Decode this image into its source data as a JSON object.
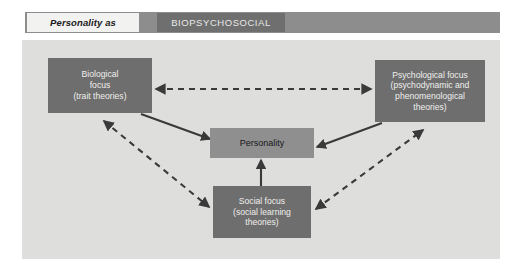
{
  "header": {
    "tag_label": "Personality as",
    "title": "BIOPSYCHOSOCIAL"
  },
  "diagram": {
    "nodes": [
      {
        "id": "biological",
        "lines": [
          "Biological",
          "focus",
          "(trait theories)"
        ],
        "text": "Biological focus (trait theories)"
      },
      {
        "id": "psychological",
        "lines": [
          "Psychological focus",
          "(psychodynamic and",
          "phenomenological",
          "theories)"
        ],
        "text": "Psychological focus (psychodynamic and phenomenological theories)"
      },
      {
        "id": "personality",
        "lines": [
          "Personality"
        ],
        "text": "Personality"
      },
      {
        "id": "social",
        "lines": [
          "Social focus",
          "(social learning",
          "theories)"
        ],
        "text": "Social focus (social learning theories)"
      }
    ],
    "edges": [
      {
        "from": "biological",
        "to": "psychological",
        "style": "dashed",
        "arrows": "both"
      },
      {
        "from": "biological",
        "to": "social",
        "style": "dashed",
        "arrows": "both"
      },
      {
        "from": "social",
        "to": "psychological",
        "style": "dashed",
        "arrows": "both"
      },
      {
        "from": "biological",
        "to": "personality",
        "style": "solid",
        "arrows": "to"
      },
      {
        "from": "psychological",
        "to": "personality",
        "style": "solid",
        "arrows": "to"
      },
      {
        "from": "social",
        "to": "personality",
        "style": "solid",
        "arrows": "to"
      }
    ]
  },
  "colors": {
    "page_background": "#ffffff",
    "panel_background": "#dededc",
    "header_band": "#8d8d8d",
    "header_tag_background": "#f2f2f1",
    "header_title_background": "#6f6f6f",
    "node_fill": "#6e6e6e",
    "center_node_fill": "#8f8f8f",
    "node_text": "#f0efed",
    "center_node_text": "#17161a",
    "arrow_stroke": "#3a3a3a"
  }
}
